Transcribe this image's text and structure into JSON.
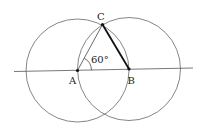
{
  "diagram": {
    "points": {
      "A": {
        "label": "A",
        "x": 77.5,
        "y": 70.5
      },
      "B": {
        "label": "B",
        "x": 129,
        "y": 69
      },
      "C": {
        "label": "C",
        "x": 102.5,
        "y": 24.5
      }
    },
    "angle_label": "60°",
    "circles": [
      {
        "center": "A",
        "radius": 51.5
      },
      {
        "center": "B",
        "radius": 51.5
      }
    ],
    "line": {
      "x1": 14,
      "y1": 71.5,
      "x2": 193,
      "y2": 68
    },
    "colors": {
      "stroke": "#555555",
      "bold_stroke": "#111111",
      "point": "#111111"
    }
  }
}
